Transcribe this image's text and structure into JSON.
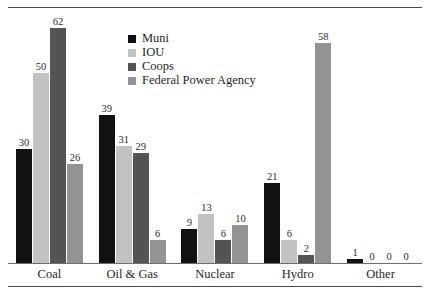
{
  "figure": {
    "top_cut_text": "",
    "rule_color": "#4a4a4a"
  },
  "legend": {
    "position": "inside-top-center",
    "items": [
      {
        "label": "Muni",
        "color": "#111111"
      },
      {
        "label": "IOU",
        "color": "#c2c2c2"
      },
      {
        "label": "Coops",
        "color": "#545454"
      },
      {
        "label": "Federal Power Agency",
        "color": "#939393"
      }
    ]
  },
  "chart_data": {
    "type": "bar",
    "title": "",
    "xlabel": "",
    "ylabel": "",
    "ylim": [
      0,
      62
    ],
    "grid": false,
    "legend_position": "inside-top-center",
    "categories": [
      "Coal",
      "Oil & Gas",
      "Nuclear",
      "Hydro",
      "Other"
    ],
    "series": [
      {
        "name": "Muni",
        "color": "#111111",
        "values": [
          30,
          39,
          9,
          21,
          1
        ]
      },
      {
        "name": "IOU",
        "color": "#c2c2c2",
        "values": [
          50,
          31,
          13,
          6,
          0
        ]
      },
      {
        "name": "Coops",
        "color": "#545454",
        "values": [
          62,
          29,
          6,
          2,
          0
        ]
      },
      {
        "name": "Federal Power Agency",
        "color": "#939393",
        "values": [
          26,
          6,
          10,
          58,
          0
        ]
      }
    ]
  }
}
